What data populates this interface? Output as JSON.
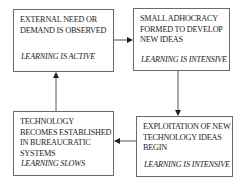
{
  "diagram": {
    "type": "cycle-flowchart",
    "nodes": [
      {
        "id": "n1",
        "title": "EXTERNAL NEED OR DEMAND IS OBSERVED",
        "title_lines": [
          "EXTERNAL NEED OR",
          "DEMAND IS OBSERVED"
        ],
        "status": "LEARNING  IS ACTIVE"
      },
      {
        "id": "n2",
        "title": "SMALL ADHOCRACY FORMED TO DEVELOP NEW IDEAS",
        "title_lines": [
          "SMALL ADHOCRACY",
          "FORMED TO DEVELOP",
          "NEW IDEAS"
        ],
        "status": "LEARNING  IS INTENSIVE"
      },
      {
        "id": "n3",
        "title": "EXPLOITATION OF NEW TECHNOLOGY IDEAS BEGIN",
        "title_lines": [
          "EXPLOITATION OF NEW",
          "TECHNOLOGY IDEAS",
          "BEGIN"
        ],
        "status": "LEARNING  IS INTENSIVE"
      },
      {
        "id": "n4",
        "title": "TECHNOLOGY BECOMES ESTABLISHED IN BUREAUCRATIC SYSTEMS",
        "title_lines": [
          "TECHNOLOGY",
          "BECOMES ESTABLISHED",
          "IN BUREAUCRATIC",
          "SYSTEMS"
        ],
        "status": "LEARNING  SLOWS"
      }
    ],
    "edges": [
      {
        "from": "n1",
        "to": "n2"
      },
      {
        "from": "n2",
        "to": "n3"
      },
      {
        "from": "n3",
        "to": "n4"
      },
      {
        "from": "n4",
        "to": "n1"
      }
    ],
    "colors": {
      "border": "#6a6a6a",
      "arrow": "#333333",
      "text": "#222222"
    }
  }
}
